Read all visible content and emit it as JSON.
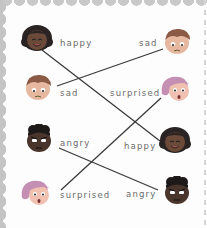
{
  "worksheet": {
    "title": "Match the emotions",
    "left_column": [
      {
        "label": "happy",
        "face": "happy-girl-face"
      },
      {
        "label": "sad",
        "face": "sad-boy-face"
      },
      {
        "label": "angry",
        "face": "angry-child-face"
      },
      {
        "label": "surprised",
        "face": "surprised-girl-face"
      }
    ],
    "right_column": [
      {
        "label": "sad",
        "face": "sad-boy-face"
      },
      {
        "label": "surprised",
        "face": "surprised-girl-face"
      },
      {
        "label": "happy",
        "face": "happy-girl-face"
      },
      {
        "label": "angry",
        "face": "angry-child-face"
      }
    ],
    "matches": [
      {
        "from": "happy",
        "to": "happy"
      },
      {
        "from": "sad",
        "to": "sad"
      },
      {
        "from": "angry",
        "to": "angry"
      },
      {
        "from": "surprised",
        "to": "surprised"
      }
    ],
    "colors": {
      "border": "#c6c6c6",
      "line": "#3a3a3a",
      "label": "#6b6b6b",
      "skin_dark": "#6b4a3a",
      "skin_light": "#e6b8a0",
      "hair_dark": "#2a2323",
      "hair_brown": "#8a5a44",
      "hair_pink": "#c58fb3"
    }
  }
}
